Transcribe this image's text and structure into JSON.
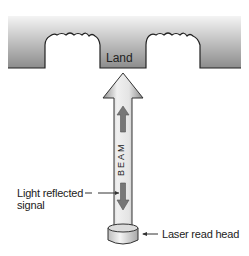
{
  "diagram": {
    "labels": {
      "land": "Land",
      "beam": "BEAM",
      "reflected_line1": "Light reflected",
      "reflected_line2": "signal",
      "laser_head": "Laser read head"
    },
    "colors": {
      "disc_top": "#f2f2f2",
      "disc_bottom": "#8a8a8a",
      "outline": "#222222",
      "beam_light": "#e8e8e8",
      "beam_dark": "#9a9a9a",
      "arrow_fill": "#777777"
    }
  }
}
